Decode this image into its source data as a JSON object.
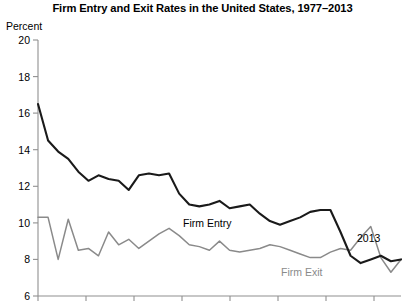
{
  "chart_data": {
    "type": "line",
    "title": "Firm Entry and Exit Rates in the United States, 1977–2013",
    "xlabel": "",
    "ylabel": "Percent",
    "ylim": [
      6,
      20
    ],
    "xlim": [
      1977,
      2013
    ],
    "grid": false,
    "legend_position": "inline-annotations",
    "y_ticks": [
      20,
      18,
      16,
      14,
      12,
      10,
      8,
      6
    ],
    "y_tick_labels": [
      "20",
      "18",
      "16",
      "14",
      "12",
      "10",
      "8",
      "6"
    ],
    "x_ticks": [
      1977,
      1982,
      1987,
      1992,
      1997,
      2002,
      2007,
      2012
    ],
    "x_tick_labels": [
      "",
      "",
      "",
      "",
      "",
      "",
      "",
      ""
    ],
    "x": [
      1977,
      1978,
      1979,
      1980,
      1981,
      1982,
      1983,
      1984,
      1985,
      1986,
      1987,
      1988,
      1989,
      1990,
      1991,
      1992,
      1993,
      1994,
      1995,
      1996,
      1997,
      1998,
      1999,
      2000,
      2001,
      2002,
      2003,
      2004,
      2005,
      2006,
      2007,
      2008,
      2009,
      2010,
      2011,
      2012,
      2013
    ],
    "series": [
      {
        "name": "Firm Entry",
        "color": "#1a1a1a",
        "values": [
          16.5,
          14.5,
          13.9,
          13.5,
          12.8,
          12.3,
          12.6,
          12.4,
          12.3,
          11.8,
          12.6,
          12.7,
          12.6,
          12.7,
          11.6,
          11.0,
          10.9,
          11.0,
          11.2,
          10.8,
          10.9,
          11.0,
          10.5,
          10.1,
          9.9,
          10.1,
          10.3,
          10.6,
          10.7,
          10.7,
          9.5,
          8.2,
          7.8,
          8.0,
          8.2,
          7.9,
          8.0
        ]
      },
      {
        "name": "Firm Exit",
        "color": "#8a8a8a",
        "values": [
          10.3,
          10.3,
          8.0,
          10.2,
          8.5,
          8.6,
          8.2,
          9.5,
          8.8,
          9.1,
          8.6,
          9.0,
          9.4,
          9.7,
          9.3,
          8.8,
          8.7,
          8.5,
          9.0,
          8.5,
          8.4,
          8.5,
          8.6,
          8.8,
          8.7,
          8.5,
          8.3,
          8.1,
          8.1,
          8.4,
          8.6,
          8.5,
          9.2,
          9.8,
          8.1,
          7.3,
          8.0
        ]
      }
    ],
    "annotations": [
      {
        "text": "Firm Entry",
        "series": "Firm Entry"
      },
      {
        "text": "Firm Exit",
        "series": "Firm Exit"
      },
      {
        "text": "2013",
        "series": "Firm Entry"
      }
    ]
  },
  "axis": {
    "y_label": "Percent",
    "y_tick_0": "20",
    "y_tick_1": "18",
    "y_tick_2": "16",
    "y_tick_3": "14",
    "y_tick_4": "12",
    "y_tick_5": "10",
    "y_tick_6": "8",
    "y_tick_7": "6"
  },
  "colors": {
    "entry_line": "#1a1a1a",
    "exit_line": "#8a8a8a",
    "axis": "#808080",
    "text": "#000000",
    "background": "#ffffff"
  }
}
